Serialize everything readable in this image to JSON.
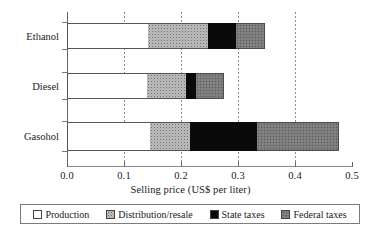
{
  "chart_data": {
    "type": "bar",
    "orientation": "horizontal",
    "stacked": true,
    "title": "",
    "xlabel": "Selling price (US$ per liter)",
    "ylabel": "",
    "xlim": [
      0.0,
      0.5
    ],
    "xticks": [
      "0.0",
      "0.1",
      "0.2",
      "0.3",
      "0.4",
      "0.5"
    ],
    "xtick_values": [
      0.0,
      0.1,
      0.2,
      0.3,
      0.4,
      0.5
    ],
    "grid": "vertical-dotted",
    "legend_position": "bottom",
    "categories": [
      "Ethanol",
      "Diesel",
      "Gasohol"
    ],
    "series": [
      {
        "name": "Production",
        "values": [
          0.142,
          0.14,
          0.145
        ]
      },
      {
        "name": "Distribution/resale",
        "values": [
          0.105,
          0.068,
          0.07
        ]
      },
      {
        "name": "State taxes",
        "values": [
          0.049,
          0.019,
          0.118
        ]
      },
      {
        "name": "Federal taxes",
        "values": [
          0.051,
          0.048,
          0.144
        ]
      }
    ],
    "totals": [
      0.347,
      0.275,
      0.477
    ]
  },
  "axis": {
    "x_title": "Selling price (US$ per liter)",
    "x_tick_labels": [
      "0.0",
      "0.1",
      "0.2",
      "0.3",
      "0.4",
      "0.5"
    ],
    "y_categories": [
      "Ethanol",
      "Diesel",
      "Gasohol"
    ]
  },
  "legend": {
    "items": [
      {
        "label": "Production",
        "color": "#ffffff",
        "pattern": "solid-white"
      },
      {
        "label": "Distribution/resale",
        "color": "#bcbcbc",
        "pattern": "fine-dotted-light"
      },
      {
        "label": "State taxes",
        "color": "#0a0a0a",
        "pattern": "solid-black"
      },
      {
        "label": "Federal taxes",
        "color": "#7b7b7b",
        "pattern": "fine-dotted-dark"
      }
    ]
  },
  "colors": {
    "production": "#ffffff",
    "distribution": "#bcbcbc",
    "state_taxes": "#0a0a0a",
    "federal_taxes": "#7b7b7b",
    "axis": "#666666",
    "grid": "#8c8c8c",
    "text": "#1a1a1a"
  }
}
